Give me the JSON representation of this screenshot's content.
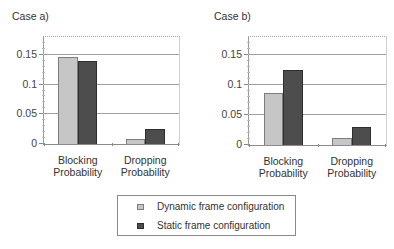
{
  "legend": {
    "items": [
      {
        "label": "Dynamic frame configuration",
        "color": "#c6c6c6",
        "border": "#7d7d7d"
      },
      {
        "label": "Static frame configuration",
        "color": "#4d4d4d",
        "border": "#2e2e2e"
      }
    ]
  },
  "chart_data": [
    {
      "type": "bar",
      "title": "Case a)",
      "categories": [
        "Blocking Probability",
        "Dropping Probability"
      ],
      "category_label_lines": [
        [
          "Blocking",
          "Probability"
        ],
        [
          "Dropping",
          "Probability"
        ]
      ],
      "series": [
        {
          "name": "Dynamic frame configuration",
          "values": [
            0.146,
            0.008
          ]
        },
        {
          "name": "Static frame configuration",
          "values": [
            0.139,
            0.025
          ]
        }
      ],
      "xlabel": "",
      "ylabel": "",
      "ylim": [
        0,
        0.18
      ],
      "yticks": [
        0,
        0.05,
        0.1,
        0.15
      ],
      "ytick_labels": [
        "0",
        "0.05",
        "0.1",
        "0.15"
      ],
      "grid": true,
      "legend_position": "bottom (shared)"
    },
    {
      "type": "bar",
      "title": "Case b)",
      "categories": [
        "Blocking Probability",
        "Dropping Probability"
      ],
      "category_label_lines": [
        [
          "Blocking",
          "Probability"
        ],
        [
          "Dropping",
          "Probability"
        ]
      ],
      "series": [
        {
          "name": "Dynamic frame configuration",
          "values": [
            0.087,
            0.012
          ]
        },
        {
          "name": "Static frame configuration",
          "values": [
            0.125,
            0.03
          ]
        }
      ],
      "xlabel": "",
      "ylabel": "",
      "ylim": [
        0,
        0.18
      ],
      "yticks": [
        0,
        0.05,
        0.1,
        0.15
      ],
      "ytick_labels": [
        "0",
        "0.05",
        "0.1",
        "0.15"
      ],
      "grid": true,
      "legend_position": "bottom (shared)"
    }
  ]
}
